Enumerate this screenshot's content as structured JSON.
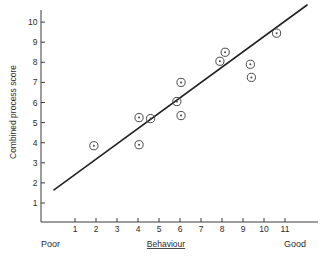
{
  "chart_data": {
    "type": "scatter",
    "title": "",
    "xlabel": "Behaviour",
    "ylabel": "Combined process score",
    "xlim": [
      0,
      12.1
    ],
    "ylim": [
      0,
      10.9
    ],
    "grid": false,
    "legend": null,
    "xticks": [
      1,
      2,
      3,
      4,
      5,
      6,
      7,
      8,
      9,
      10,
      11
    ],
    "yticks": [
      1,
      2,
      3,
      4,
      5,
      6,
      7,
      8,
      9,
      10
    ],
    "x": [
      1.9,
      4.05,
      4.05,
      4.6,
      5.85,
      6.05,
      6.05,
      7.9,
      8.15,
      9.35,
      9.4,
      10.6
    ],
    "y": [
      3.85,
      5.25,
      3.9,
      5.2,
      6.05,
      7.0,
      5.35,
      8.05,
      8.5,
      7.9,
      7.25,
      9.45
    ],
    "points": [
      {
        "x": 1.9,
        "y": 3.85
      },
      {
        "x": 4.05,
        "y": 5.25
      },
      {
        "x": 4.05,
        "y": 3.9
      },
      {
        "x": 4.6,
        "y": 5.2
      },
      {
        "x": 5.85,
        "y": 6.05
      },
      {
        "x": 6.05,
        "y": 7.0
      },
      {
        "x": 6.05,
        "y": 5.35
      },
      {
        "x": 7.9,
        "y": 8.05
      },
      {
        "x": 8.15,
        "y": 8.5
      },
      {
        "x": 9.35,
        "y": 7.9
      },
      {
        "x": 9.4,
        "y": 7.25
      },
      {
        "x": 10.6,
        "y": 9.45
      }
    ],
    "fit_line": {
      "x0": 0.0,
      "y0": 1.65,
      "x1": 12.05,
      "y1": 10.85,
      "style": "solid"
    },
    "annotations": {
      "x_axis_left_anchor": "Poor",
      "x_axis_right_anchor": "Good"
    }
  },
  "axis": {
    "y_title": "Combined process score",
    "x_title": "Behaviour",
    "x_tick_labels": [
      "1",
      "2",
      "3",
      "4",
      "5",
      "6",
      "7",
      "8",
      "9",
      "10",
      "11"
    ],
    "y_tick_labels": [
      "1",
      "2",
      "3",
      "4",
      "5",
      "6",
      "7",
      "8",
      "9",
      "10"
    ]
  },
  "anchors": {
    "left": "Poor",
    "right": "Good"
  },
  "colors": {
    "axis": "#3a3a3a",
    "line": "#222222",
    "marker": "#4a4a4a",
    "background": "#ffffff",
    "text": "#2b2b2b"
  }
}
